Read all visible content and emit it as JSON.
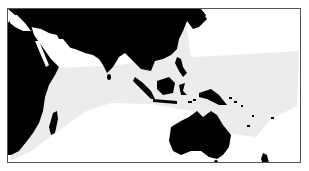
{
  "map": {
    "region": "Indo-Pacific",
    "colors": {
      "land": "#000000",
      "range": "#ececec",
      "ocean": "#ffffff",
      "border": "#555555"
    },
    "legend": []
  }
}
